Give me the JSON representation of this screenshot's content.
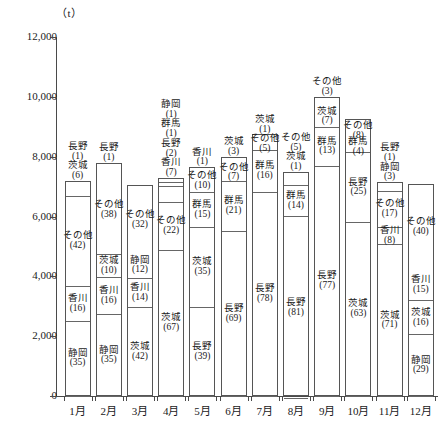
{
  "unit_label": "（t）",
  "axis": {
    "y_ticks": [
      "12,000",
      "10,000",
      "8,000",
      "6,000",
      "4,000",
      "2,000",
      "0"
    ],
    "y_tick_values": [
      12000,
      10000,
      8000,
      6000,
      4000,
      2000,
      0
    ],
    "x_labels": [
      "1月",
      "2月",
      "3月",
      "4月",
      "5月",
      "6月",
      "7月",
      "8月",
      "9月",
      "10月",
      "11月",
      "12月"
    ]
  },
  "chart_data": {
    "type": "bar",
    "subtype": "stacked-bar-percentage-composition",
    "title": "",
    "subtitle": "",
    "xlabel": "",
    "ylabel": "（t）",
    "ylim": [
      0,
      12000
    ],
    "ytick_interval": 2000,
    "grid": false,
    "legend_position": "none",
    "value_unit": "t",
    "segment_value_unit": "%",
    "categories": [
      "1月",
      "2月",
      "3月",
      "4月",
      "5月",
      "6月",
      "7月",
      "8月",
      "9月",
      "10月",
      "11月",
      "12月"
    ],
    "totals": [
      7200,
      7800,
      7050,
      7300,
      7650,
      8000,
      8750,
      7500,
      10000,
      9250,
      7150,
      7100
    ],
    "series": [
      {
        "name": "静岡",
        "values": [
          35,
          35,
          12,
          1,
          0,
          0,
          0,
          0,
          0,
          0,
          3,
          29
        ]
      },
      {
        "name": "香川",
        "values": [
          16,
          16,
          14,
          7,
          1,
          0,
          0,
          0,
          0,
          0,
          8,
          15
        ]
      },
      {
        "name": "茨城",
        "values": [
          6,
          10,
          42,
          67,
          35,
          3,
          1,
          1,
          7,
          63,
          71,
          16
        ]
      },
      {
        "name": "長野",
        "values": [
          1,
          1,
          0,
          2,
          39,
          69,
          78,
          81,
          77,
          25,
          1,
          0
        ]
      },
      {
        "name": "群馬",
        "values": [
          0,
          0,
          0,
          1,
          15,
          21,
          16,
          14,
          13,
          4,
          0,
          0
        ]
      },
      {
        "name": "その他",
        "values": [
          42,
          38,
          32,
          22,
          10,
          7,
          5,
          5,
          3,
          8,
          17,
          40
        ]
      }
    ],
    "bars": [
      {
        "month": "1月",
        "total": 7200,
        "segments": [
          {
            "name": "静岡",
            "value": 35,
            "inside": true
          },
          {
            "name": "香川",
            "value": 16,
            "inside": true
          },
          {
            "name": "その他",
            "value": 42,
            "inside": true
          },
          {
            "name": "茨城",
            "value": 6,
            "inside": false
          },
          {
            "name": "長野",
            "value": 1,
            "inside": false
          }
        ]
      },
      {
        "month": "2月",
        "total": 7800,
        "segments": [
          {
            "name": "静岡",
            "value": 35,
            "inside": true
          },
          {
            "name": "香川",
            "value": 16,
            "inside": true
          },
          {
            "name": "茨城",
            "value": 10,
            "inside": true
          },
          {
            "name": "その他",
            "value": 38,
            "inside": true
          },
          {
            "name": "長野",
            "value": 1,
            "inside": false
          }
        ]
      },
      {
        "month": "3月",
        "total": 7050,
        "segments": [
          {
            "name": "茨城",
            "value": 42,
            "inside": true
          },
          {
            "name": "香川",
            "value": 14,
            "inside": true
          },
          {
            "name": "静岡",
            "value": 12,
            "inside": true
          },
          {
            "name": "その他",
            "value": 32,
            "inside": true
          }
        ]
      },
      {
        "month": "4月",
        "total": 7300,
        "segments": [
          {
            "name": "茨城",
            "value": 67,
            "inside": true
          },
          {
            "name": "その他",
            "value": 22,
            "inside": true
          },
          {
            "name": "香川",
            "value": 7,
            "inside": false
          },
          {
            "name": "長野",
            "value": 2,
            "inside": false
          },
          {
            "name": "群馬",
            "value": 1,
            "inside": false
          },
          {
            "name": "静岡",
            "value": 1,
            "inside": false
          }
        ]
      },
      {
        "month": "5月",
        "total": 7650,
        "segments": [
          {
            "name": "長野",
            "value": 39,
            "inside": true
          },
          {
            "name": "茨城",
            "value": 35,
            "inside": true
          },
          {
            "name": "群馬",
            "value": 15,
            "inside": true
          },
          {
            "name": "その他",
            "value": 10,
            "inside": true
          },
          {
            "name": "香川",
            "value": 1,
            "inside": false
          }
        ]
      },
      {
        "month": "6月",
        "total": 8000,
        "segments": [
          {
            "name": "長野",
            "value": 69,
            "inside": true
          },
          {
            "name": "群馬",
            "value": 21,
            "inside": true
          },
          {
            "name": "その他",
            "value": 7,
            "inside": true
          },
          {
            "name": "茨城",
            "value": 3,
            "inside": false
          }
        ]
      },
      {
        "month": "7月",
        "total": 8750,
        "segments": [
          {
            "name": "長野",
            "value": 78,
            "inside": true
          },
          {
            "name": "群馬",
            "value": 16,
            "inside": true
          },
          {
            "name": "その他",
            "value": 5,
            "inside": true
          },
          {
            "name": "茨城",
            "value": 1,
            "inside": false
          }
        ]
      },
      {
        "month": "8月",
        "total": 7500,
        "segments": [
          {
            "name": "長野",
            "value": 81,
            "inside": true
          },
          {
            "name": "群馬",
            "value": 14,
            "inside": true
          },
          {
            "name": "茨城",
            "value": 1,
            "inside": false
          },
          {
            "name": "その他",
            "value": 5,
            "inside": false
          }
        ]
      },
      {
        "month": "9月",
        "total": 10000,
        "segments": [
          {
            "name": "長野",
            "value": 77,
            "inside": true
          },
          {
            "name": "群馬",
            "value": 13,
            "inside": true
          },
          {
            "name": "茨城",
            "value": 7,
            "inside": true
          },
          {
            "name": "その他",
            "value": 3,
            "inside": false
          }
        ]
      },
      {
        "month": "10月",
        "total": 9250,
        "segments": [
          {
            "name": "茨城",
            "value": 63,
            "inside": true
          },
          {
            "name": "長野",
            "value": 25,
            "inside": true
          },
          {
            "name": "群馬",
            "value": 4,
            "inside": true
          },
          {
            "name": "その他",
            "value": 8,
            "inside": true
          }
        ]
      },
      {
        "month": "11月",
        "total": 7150,
        "segments": [
          {
            "name": "茨城",
            "value": 71,
            "inside": true
          },
          {
            "name": "香川",
            "value": 8,
            "inside": true
          },
          {
            "name": "その他",
            "value": 17,
            "inside": true
          },
          {
            "name": "静岡",
            "value": 3,
            "inside": false
          },
          {
            "name": "長野",
            "value": 1,
            "inside": false
          }
        ]
      },
      {
        "month": "12月",
        "total": 7100,
        "segments": [
          {
            "name": "静岡",
            "value": 29,
            "inside": true
          },
          {
            "name": "茨城",
            "value": 16,
            "inside": true
          },
          {
            "name": "香川",
            "value": 15,
            "inside": true
          },
          {
            "name": "その他",
            "value": 40,
            "inside": true
          }
        ]
      }
    ]
  }
}
